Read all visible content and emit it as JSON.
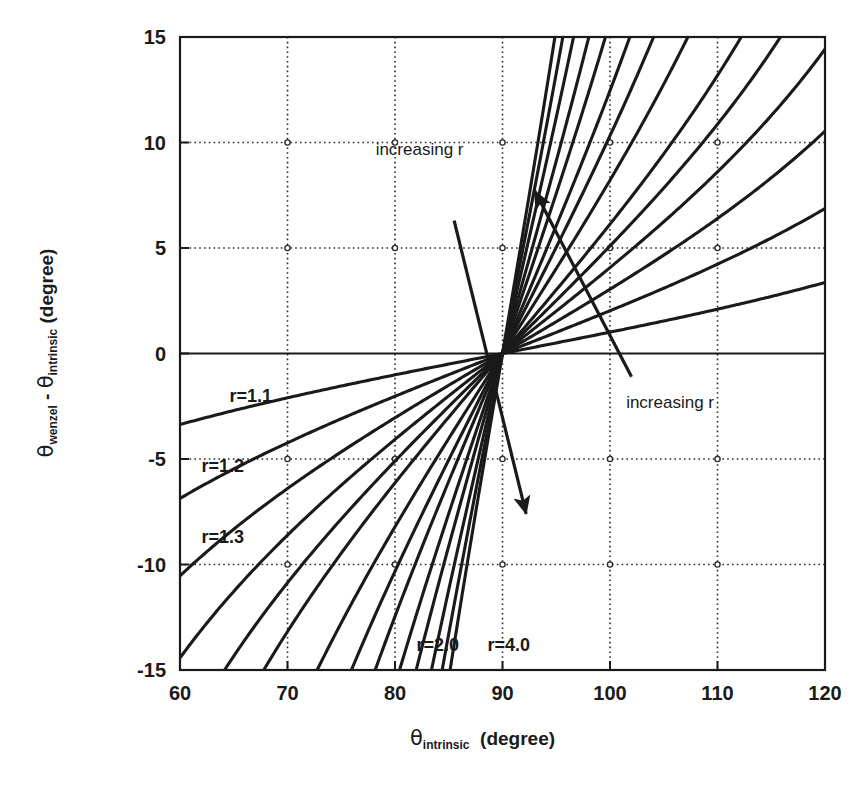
{
  "figure": {
    "background": "#ffffff",
    "ink": "#1a1a1a",
    "caption_fragment": ""
  },
  "axes": {
    "x": {
      "label_main": "θ",
      "label_sub": "intrinsic",
      "label_unit": "(degree)",
      "min": 60,
      "max": 120,
      "ticks": [
        60,
        70,
        80,
        90,
        100,
        110,
        120
      ],
      "tick_labels": [
        "60",
        "70",
        "80",
        "90",
        "100",
        "110",
        "120"
      ]
    },
    "y": {
      "label_part1": "θ",
      "label_sub1": "wenzel",
      "label_minus": "-",
      "label_part2": "θ",
      "label_sub2": "intrinsic",
      "label_unit": "(degree)",
      "min": -15,
      "max": 15,
      "ticks": [
        15,
        10,
        5,
        0,
        -5,
        -10,
        -15
      ],
      "tick_labels": [
        "15",
        "10",
        "5",
        "0",
        "-5",
        "-10",
        "-15"
      ]
    },
    "grid": "dotted",
    "grid_color": "#2b2b2b",
    "frame_color": "#1a1a1a"
  },
  "annotations": [
    {
      "name": "increasing-r-upper",
      "text": "increasing r",
      "x": 78.2,
      "y": 9.4
    },
    {
      "name": "increasing-r-lower",
      "text": "increasing r",
      "x": 101.5,
      "y": -2.6
    }
  ],
  "arrows": [
    {
      "name": "arrow-down-right",
      "x1": 85.5,
      "y1": 6.3,
      "x2": 92.2,
      "y2": -7.6
    },
    {
      "name": "arrow-up-left",
      "x1": 102.0,
      "y1": -1.1,
      "x2": 93.0,
      "y2": 7.7
    }
  ],
  "curve_labels": [
    {
      "name": "curve-label-r-1-1",
      "text": "r=1.1",
      "x": 64.6,
      "y": -2.3
    },
    {
      "name": "curve-label-r-1-2",
      "text": "r=1.2",
      "x": 62.0,
      "y": -5.6
    },
    {
      "name": "curve-label-r-1-3",
      "text": "r=1.3",
      "x": 62.0,
      "y": -9.0
    },
    {
      "name": "curve-label-r-2-0",
      "text": "r=2.0",
      "x": 82.0,
      "y": -14.1
    },
    {
      "name": "curve-label-r-4-0",
      "text": "r=4.0",
      "x": 88.6,
      "y": -14.1
    }
  ],
  "chart_data": {
    "type": "line",
    "title": "",
    "xlabel": "θ_intrinsic (degree)",
    "ylabel": "θ_wenzel - θ_intrinsic (degree)",
    "xlim": [
      60,
      120
    ],
    "ylim": [
      -15,
      15
    ],
    "xticks": [
      60,
      70,
      80,
      90,
      100,
      110,
      120
    ],
    "yticks": [
      -15,
      -10,
      -5,
      0,
      5,
      10,
      15
    ],
    "grid": true,
    "legend": "none",
    "equation": "cos(theta_wenzel) = r * cos(theta_intrinsic)",
    "convergence_point": [
      90,
      0
    ],
    "x_sample": [
      60,
      62,
      64,
      66,
      68,
      70,
      72,
      74,
      76,
      78,
      80,
      82,
      84,
      86,
      88,
      90,
      92,
      94,
      96,
      98,
      100,
      102,
      104,
      106,
      108,
      110,
      112,
      114,
      116,
      118,
      120
    ],
    "series": [
      {
        "name": "r=1.1",
        "r": 1.1,
        "values": [
          -3.3,
          -3.2,
          -3.1,
          -3.0,
          -2.8,
          -2.6,
          -2.5,
          -2.3,
          -2.1,
          -1.8,
          -1.6,
          -1.4,
          -1.1,
          -0.9,
          -0.6,
          0.0,
          0.6,
          0.9,
          1.1,
          1.4,
          1.6,
          1.8,
          2.1,
          2.3,
          2.5,
          2.6,
          2.8,
          3.0,
          3.1,
          3.2,
          3.3
        ]
      },
      {
        "name": "r=1.2",
        "r": 1.2,
        "values": [
          -6.9,
          -6.7,
          -6.4,
          -6.2,
          -5.9,
          -5.5,
          -5.2,
          -4.8,
          -4.4,
          -3.9,
          -3.5,
          -2.9,
          -2.4,
          -1.8,
          -1.2,
          0.0,
          1.2,
          1.8,
          2.4,
          2.9,
          3.5,
          3.9,
          4.4,
          4.8,
          5.2,
          5.5,
          5.9,
          6.2,
          6.4,
          6.7,
          6.9
        ]
      },
      {
        "name": "r=1.3",
        "r": 1.3,
        "values": [
          -10.8,
          -10.4,
          -10.0,
          -9.6,
          -9.1,
          -8.6,
          -8.0,
          -7.4,
          -6.8,
          -6.1,
          -5.4,
          -4.6,
          -3.7,
          -2.8,
          -1.9,
          0.0,
          1.9,
          2.8,
          3.7,
          4.6,
          5.4,
          6.1,
          6.8,
          7.4,
          8.0,
          8.6,
          9.1,
          9.6,
          10.0,
          10.4,
          10.8
        ]
      },
      {
        "name": "r=1.4",
        "r": 1.4,
        "values": [
          -15.0,
          -14.5,
          -13.9,
          -13.2,
          -12.5,
          -11.7,
          -10.9,
          -10.1,
          -9.2,
          -8.2,
          -7.2,
          -6.2,
          -5.0,
          -3.8,
          -2.6,
          0.0,
          2.6,
          3.8,
          5.0,
          6.2,
          7.2,
          8.2,
          9.2,
          10.1,
          10.9,
          11.7,
          12.5,
          13.2,
          13.9,
          14.5,
          15.0
        ]
      },
      {
        "name": "r=1.5",
        "r": 1.5,
        "values": [
          -15.0,
          -15.0,
          -15.0,
          -15.0,
          -15.0,
          -14.9,
          -13.8,
          -12.8,
          -11.7,
          -10.5,
          -9.2,
          -7.9,
          -6.4,
          -4.9,
          -3.3,
          0.0,
          3.3,
          4.9,
          6.4,
          7.9,
          9.2,
          10.5,
          11.7,
          12.8,
          13.8,
          14.9,
          15.0,
          15.0,
          15.0,
          15.0,
          15.0
        ]
      },
      {
        "name": "r=1.6",
        "r": 1.6,
        "values": [
          -15.0,
          -15.0,
          -15.0,
          -15.0,
          -15.0,
          -15.0,
          -15.0,
          -15.0,
          -14.1,
          -12.7,
          -11.1,
          -9.5,
          -7.8,
          -5.9,
          -4.0,
          0.0,
          4.0,
          5.9,
          7.8,
          9.5,
          11.1,
          12.7,
          14.1,
          15.0,
          15.0,
          15.0,
          15.0,
          15.0,
          15.0,
          15.0,
          15.0
        ]
      },
      {
        "name": "r=1.8",
        "r": 1.8,
        "values": [
          -15.0,
          -15.0,
          -15.0,
          -15.0,
          -15.0,
          -15.0,
          -15.0,
          -15.0,
          -15.0,
          -15.0,
          -14.5,
          -12.5,
          -10.3,
          -7.9,
          -5.3,
          0.0,
          5.3,
          7.9,
          10.3,
          12.5,
          14.5,
          15.0,
          15.0,
          15.0,
          15.0,
          15.0,
          15.0,
          15.0,
          15.0,
          15.0,
          15.0
        ]
      },
      {
        "name": "r=2.0",
        "r": 2.0,
        "values": [
          -15.0,
          -15.0,
          -15.0,
          -15.0,
          -15.0,
          -15.0,
          -15.0,
          -15.0,
          -15.0,
          -15.0,
          -15.0,
          -15.0,
          -12.6,
          -9.7,
          -6.6,
          0.0,
          6.6,
          9.7,
          12.6,
          15.0,
          15.0,
          15.0,
          15.0,
          15.0,
          15.0,
          15.0,
          15.0,
          15.0,
          15.0,
          15.0,
          15.0
        ]
      },
      {
        "name": "r=2.2",
        "r": 2.2,
        "values": [
          -15.0,
          -15.0,
          -15.0,
          -15.0,
          -15.0,
          -15.0,
          -15.0,
          -15.0,
          -15.0,
          -15.0,
          -15.0,
          -15.0,
          -14.5,
          -11.3,
          -7.7,
          0.0,
          7.7,
          11.3,
          14.5,
          15.0,
          15.0,
          15.0,
          15.0,
          15.0,
          15.0,
          15.0,
          15.0,
          15.0,
          15.0,
          15.0,
          15.0
        ]
      },
      {
        "name": "r=2.5",
        "r": 2.5,
        "values": [
          -15.0,
          -15.0,
          -15.0,
          -15.0,
          -15.0,
          -15.0,
          -15.0,
          -15.0,
          -15.0,
          -15.0,
          -15.0,
          -15.0,
          -15.0,
          -13.4,
          -9.3,
          0.0,
          9.3,
          13.4,
          15.0,
          15.0,
          15.0,
          15.0,
          15.0,
          15.0,
          15.0,
          15.0,
          15.0,
          15.0,
          15.0,
          15.0,
          15.0
        ]
      },
      {
        "name": "r=2.8",
        "r": 2.8,
        "values": [
          -15.0,
          -15.0,
          -15.0,
          -15.0,
          -15.0,
          -15.0,
          -15.0,
          -15.0,
          -15.0,
          -15.0,
          -15.0,
          -15.0,
          -15.0,
          -15.0,
          -10.7,
          0.0,
          10.7,
          15.0,
          15.0,
          15.0,
          15.0,
          15.0,
          15.0,
          15.0,
          15.0,
          15.0,
          15.0,
          15.0,
          15.0,
          15.0,
          15.0
        ]
      },
      {
        "name": "r=3.2",
        "r": 3.2,
        "values": [
          -15.0,
          -15.0,
          -15.0,
          -15.0,
          -15.0,
          -15.0,
          -15.0,
          -15.0,
          -15.0,
          -15.0,
          -15.0,
          -15.0,
          -15.0,
          -15.0,
          -12.4,
          0.0,
          12.4,
          15.0,
          15.0,
          15.0,
          15.0,
          15.0,
          15.0,
          15.0,
          15.0,
          15.0,
          15.0,
          15.0,
          15.0,
          15.0,
          15.0
        ]
      },
      {
        "name": "r=3.6",
        "r": 3.6,
        "values": [
          -15.0,
          -15.0,
          -15.0,
          -15.0,
          -15.0,
          -15.0,
          -15.0,
          -15.0,
          -15.0,
          -15.0,
          -15.0,
          -15.0,
          -15.0,
          -15.0,
          -13.9,
          0.0,
          13.9,
          15.0,
          15.0,
          15.0,
          15.0,
          15.0,
          15.0,
          15.0,
          15.0,
          15.0,
          15.0,
          15.0,
          15.0,
          15.0,
          15.0
        ]
      },
      {
        "name": "r=4.0",
        "r": 4.0,
        "values": [
          -15.0,
          -15.0,
          -15.0,
          -15.0,
          -15.0,
          -15.0,
          -15.0,
          -15.0,
          -15.0,
          -15.0,
          -15.0,
          -15.0,
          -15.0,
          -15.0,
          -15.0,
          0.0,
          15.0,
          15.0,
          15.0,
          15.0,
          15.0,
          15.0,
          15.0,
          15.0,
          15.0,
          15.0,
          15.0,
          15.0,
          15.0,
          15.0,
          15.0
        ]
      }
    ],
    "r_values": [
      1.1,
      1.2,
      1.3,
      1.4,
      1.5,
      1.6,
      1.8,
      2.0,
      2.2,
      2.5,
      2.8,
      3.2,
      3.6,
      4.0
    ]
  }
}
